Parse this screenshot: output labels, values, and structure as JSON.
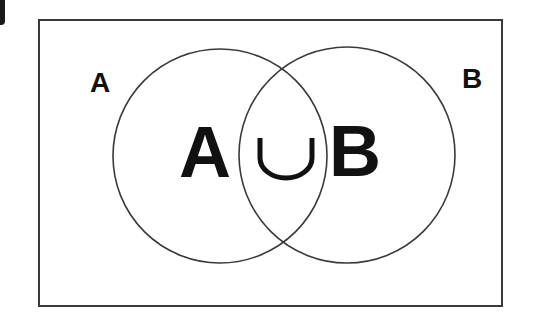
{
  "diagram": {
    "type": "venn",
    "title_expression": {
      "left": "A",
      "operator": "∪",
      "right": "B"
    },
    "sets": [
      {
        "label": "A",
        "position": "left"
      },
      {
        "label": "B",
        "position": "right"
      }
    ],
    "universe_frame": true,
    "colors": {
      "stroke": "#3a3a3a",
      "text": "#111111",
      "background": "#ffffff"
    }
  }
}
